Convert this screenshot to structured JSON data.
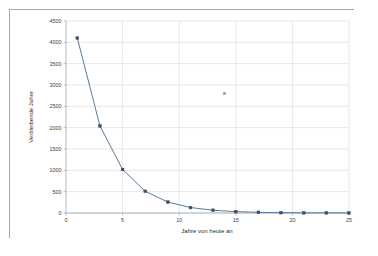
{
  "chart_data": {
    "type": "line",
    "title": "",
    "xlabel": "Jahre von heute an",
    "ylabel": "Verbleibende Jahre",
    "xlim": [
      0,
      25
    ],
    "ylim": [
      0,
      4500
    ],
    "xticks": [
      0,
      5,
      10,
      15,
      20,
      25
    ],
    "yticks": [
      0,
      500,
      1000,
      1500,
      2000,
      2500,
      3000,
      3500,
      4000,
      4500
    ],
    "grid": true,
    "legend": "none",
    "series": [
      {
        "name": "Verbleibende Jahre",
        "marker": "square",
        "color": "#4a6b8a",
        "x": [
          1,
          3,
          5,
          7,
          9,
          11,
          13,
          15,
          17,
          19,
          21,
          23,
          25
        ],
        "values": [
          4100,
          2040,
          1020,
          510,
          255,
          128,
          64,
          32,
          16,
          8,
          4,
          2,
          1
        ]
      },
      {
        "name": "stray-point",
        "marker": "square",
        "color": "#9aa2ab",
        "x": [
          14
        ],
        "values": [
          2800
        ]
      }
    ]
  },
  "labels": {
    "x_axis_title": "Jahre von heute an",
    "y_axis_title": "Verbleibende Jahre",
    "xticks": [
      "0",
      "5",
      "10",
      "15",
      "20",
      "25"
    ],
    "yticks": [
      "0",
      "500",
      "1000",
      "1500",
      "2000",
      "2500",
      "3000",
      "3500",
      "4000",
      "4500"
    ]
  },
  "colors": {
    "line": "#4a6b8a",
    "marker": "#3a4e63",
    "grid": "#d6d6d6",
    "axis": "#9aa7b4",
    "frame_border": "#a8a8a8",
    "background": "#ffffff"
  }
}
